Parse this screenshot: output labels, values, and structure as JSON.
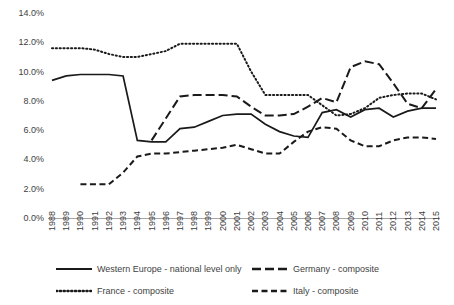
{
  "chart_data": {
    "type": "line",
    "title": "",
    "xlabel": "",
    "ylabel": "",
    "grid": false,
    "legend_position": "bottom",
    "ylim": [
      0.0,
      14.0
    ],
    "y_tick_labels": [
      "0.0%",
      "2.0%",
      "4.0%",
      "6.0%",
      "8.0%",
      "10.0%",
      "12.0%",
      "14.0%"
    ],
    "y_tick_values": [
      0.0,
      2.0,
      4.0,
      6.0,
      8.0,
      10.0,
      12.0,
      14.0
    ],
    "categories": [
      "1988",
      "1989",
      "1990",
      "1991",
      "1992",
      "1993",
      "1994",
      "1995",
      "1996",
      "1997",
      "1998",
      "1999",
      "2000",
      "2001",
      "2002",
      "2003",
      "2004",
      "2005",
      "2006",
      "2007",
      "2008",
      "2009",
      "2010",
      "2011",
      "2012",
      "2013",
      "2014",
      "2015"
    ],
    "x_tick_labels": [
      "1988",
      "1989",
      "1990",
      "1991",
      "1992",
      "1993",
      "1994",
      "1995",
      "1996",
      "1997",
      "1998",
      "1999",
      "2000",
      "2001",
      "2002",
      "2003",
      "2004",
      "2005",
      "2006",
      "2007",
      "2008",
      "2009",
      "2010",
      "2011",
      "2012",
      "2013",
      "2014",
      "2015"
    ],
    "series": [
      {
        "name": "Western Europe - national level only",
        "style": "solid",
        "color": "#1a1a1a",
        "values": [
          9.4,
          9.7,
          9.8,
          9.8,
          9.8,
          9.7,
          5.3,
          5.2,
          5.2,
          6.1,
          6.2,
          6.6,
          7.0,
          7.1,
          7.1,
          6.4,
          5.9,
          5.6,
          5.5,
          7.2,
          7.4,
          6.9,
          7.4,
          7.5,
          6.9,
          7.3,
          7.5,
          7.5
        ]
      },
      {
        "name": "Germany - composite",
        "style": "dashed-long",
        "color": "#1a1a1a",
        "values": [
          null,
          null,
          null,
          null,
          null,
          null,
          null,
          5.3,
          6.8,
          8.3,
          8.4,
          8.4,
          8.4,
          8.3,
          7.6,
          7.0,
          7.0,
          7.1,
          7.6,
          8.2,
          7.9,
          10.3,
          10.7,
          10.5,
          9.2,
          7.8,
          7.5,
          8.8
        ]
      },
      {
        "name": "France - composite",
        "style": "dotted",
        "color": "#1a1a1a",
        "values": [
          11.6,
          11.6,
          11.6,
          11.5,
          11.2,
          11.0,
          11.0,
          11.2,
          11.4,
          11.9,
          11.9,
          11.9,
          11.9,
          11.9,
          10.0,
          8.4,
          8.4,
          8.4,
          8.4,
          7.7,
          7.0,
          7.1,
          7.5,
          8.2,
          8.4,
          8.5,
          8.5,
          8.1
        ]
      },
      {
        "name": "Italy - composite",
        "style": "dashed-medium",
        "color": "#1a1a1a",
        "values": [
          null,
          null,
          2.3,
          2.3,
          2.3,
          3.1,
          4.2,
          4.4,
          4.4,
          4.5,
          4.6,
          4.7,
          4.8,
          5.0,
          4.7,
          4.4,
          4.4,
          5.2,
          5.9,
          6.2,
          6.1,
          5.3,
          4.9,
          4.9,
          5.3,
          5.5,
          5.5,
          5.4
        ]
      }
    ]
  },
  "legend": {
    "items": [
      {
        "label": "Western Europe - national level only",
        "style": "solid"
      },
      {
        "label": "Germany - composite",
        "style": "dashed-long"
      },
      {
        "label": "France - composite",
        "style": "dotted"
      },
      {
        "label": "Italy - composite",
        "style": "dashed-medium"
      }
    ]
  }
}
